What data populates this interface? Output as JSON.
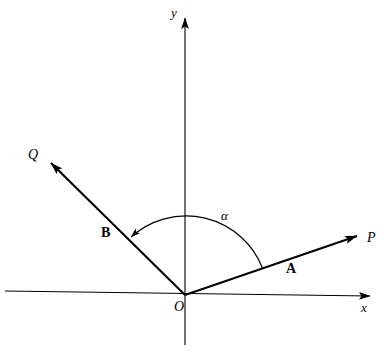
{
  "figure": {
    "background_color": "#ffffff",
    "stroke_color": "#000000"
  },
  "axes": {
    "x_label": "x",
    "y_label": "y",
    "origin_label": "O",
    "x_axis": {
      "x1": 5,
      "y1": 291,
      "x2": 376,
      "y2": 296
    },
    "y_axis": {
      "x1": 185,
      "y1": 345,
      "x2": 185,
      "y2": 12
    }
  },
  "vectors": [
    {
      "name": "A",
      "label": "A",
      "tip_label": "P",
      "from": {
        "x": 185,
        "y": 295
      },
      "to": {
        "x": 364,
        "y": 234
      },
      "angle_deg_from_x_axis": 19,
      "label_pos": {
        "x": 291,
        "y": 269
      },
      "tip_label_pos": {
        "x": 372,
        "y": 238
      }
    },
    {
      "name": "B",
      "label": "B",
      "tip_label": "Q",
      "from": {
        "x": 185,
        "y": 295
      },
      "to": {
        "x": 44,
        "y": 156
      },
      "angle_deg_from_x_axis": 135,
      "label_pos": {
        "x": 107,
        "y": 233
      },
      "tip_label_pos": {
        "x": 33,
        "y": 155
      }
    }
  ],
  "angle_arc": {
    "label": "α",
    "label_pos": {
      "x": 226,
      "y": 216
    },
    "center": {
      "x": 185,
      "y": 295
    },
    "radius": 82,
    "start_angle_deg": 19,
    "end_angle_deg": 135,
    "arrow_at": "end"
  }
}
